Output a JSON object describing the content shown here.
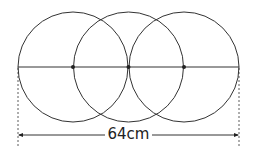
{
  "diagram": {
    "circles": [
      {
        "cx": 73,
        "cy": 67,
        "r": 55
      },
      {
        "cx": 128.5,
        "cy": 67,
        "r": 55
      },
      {
        "cx": 184,
        "cy": 67,
        "r": 55
      }
    ],
    "center_points": [
      73,
      128.5,
      184
    ],
    "total_length_label": "64cm",
    "colors": {
      "stroke": "#333333",
      "background": "#ffffff"
    }
  }
}
